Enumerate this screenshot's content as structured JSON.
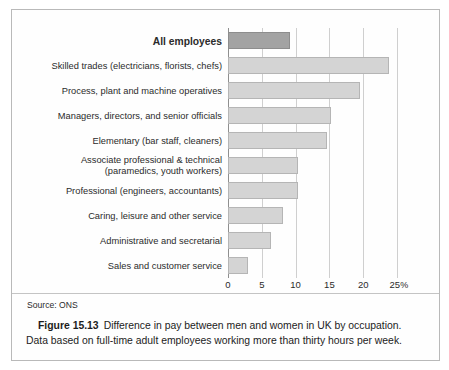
{
  "figure": {
    "source_note": "Source: ONS",
    "figure_number": "Figure 15.13",
    "caption_line1": "Difference in pay between men and women in UK by occupation.",
    "caption_line2": "Data based on full-time adult employees working more than thirty hours per week."
  },
  "colors": {
    "bar_fill": "#d4d4d4",
    "bar_border": "#b5b5b5",
    "highlight_fill": "#a3a3a3",
    "highlight_border": "#8d8d8d",
    "gridline": "#cfcfcf",
    "axis": "#8f8f8f",
    "frame": "#b9b9b9",
    "text": "#2b2b2b"
  },
  "chart_data": {
    "type": "bar",
    "orientation": "horizontal",
    "title": "",
    "xlabel": "",
    "ylabel": "",
    "xlim": [
      0,
      25
    ],
    "xticks": [
      0,
      5,
      10,
      15,
      20,
      25
    ],
    "xtick_labels": [
      "0",
      "5",
      "10",
      "15",
      "20",
      "25"
    ],
    "x_unit_suffix": "%",
    "grid": true,
    "legend": false,
    "categories": [
      "All employees",
      "Skilled trades (electricians, florists, chefs)",
      "Process, plant and machine operatives",
      "Managers, directors, and senior officials",
      "Elementary (bar staff, cleaners)",
      "Associate professional & technical\n(paramedics, youth workers)",
      "Professional (engineers, accountants)",
      "Caring, leisure and other service",
      "Administrative and secretarial",
      "Sales and customer service"
    ],
    "values": [
      9.1,
      23.8,
      19.5,
      15.3,
      14.7,
      10.3,
      10.3,
      8.2,
      6.3,
      3.0
    ],
    "highlighted_categories": [
      "All employees"
    ]
  }
}
